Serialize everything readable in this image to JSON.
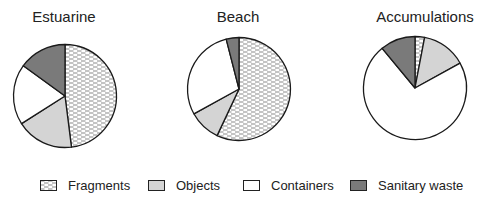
{
  "chart_data": {
    "type": "pie",
    "legend": [
      "Fragments",
      "Objects",
      "Containers",
      "Sanitary waste"
    ],
    "legend_position": "bottom",
    "colors": {
      "Fragments": "pattern-dashes",
      "Objects": "#d4d4d4",
      "Containers": "#ffffff",
      "Sanitary waste": "#7a7a7a"
    },
    "charts": [
      {
        "title": "Estuarine",
        "categories": [
          "Fragments",
          "Objects",
          "Containers",
          "Sanitary waste"
        ],
        "values": [
          48,
          18,
          19,
          15
        ]
      },
      {
        "title": "Beach",
        "categories": [
          "Fragments",
          "Objects",
          "Containers",
          "Sanitary waste"
        ],
        "values": [
          57,
          10,
          29,
          4
        ]
      },
      {
        "title": "Accumulations",
        "categories": [
          "Fragments",
          "Objects",
          "Containers",
          "Sanitary waste"
        ],
        "values": [
          3,
          14,
          72,
          11
        ]
      }
    ]
  },
  "titles": [
    "Estuarine",
    "Beach",
    "Accumulations"
  ],
  "legend": {
    "fragments": "Fragments",
    "objects": "Objects",
    "containers": "Containers",
    "sanitary": "Sanitary waste"
  }
}
